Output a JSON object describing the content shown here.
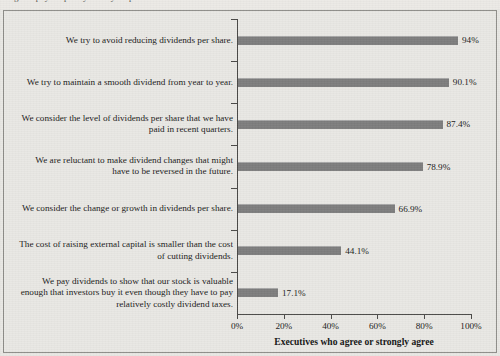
{
  "page": {
    "top_cut_text": "Figure: payout policy survey responses of chief financial officers"
  },
  "chart_data": {
    "type": "bar",
    "orientation": "horizontal",
    "title": "",
    "xlabel": "Executives who agree or strongly agree",
    "ylabel": "",
    "xlim": [
      0,
      100
    ],
    "grid": false,
    "legend": "none",
    "bar_color": "#7d7d7d",
    "categories": [
      "We try to avoid reducing dividends per share.",
      "We try to maintain a smooth dividend from year to year.",
      "We consider the level of dividends per share that we have paid in recent quarters.",
      "We are reluctant to make dividend changes that might have to be reversed in the future.",
      "We consider the change or growth in dividends per share.",
      "The cost of raising external capital is smaller than the cost of cutting dividends.",
      "We pay dividends to show that our stock is valuable enough that investors buy it even though they have to pay relatively costly dividend taxes."
    ],
    "values": [
      94,
      90.1,
      87.4,
      78.9,
      66.9,
      44.1,
      17.1
    ],
    "value_labels": [
      "94%",
      "90.1%",
      "87.4%",
      "78.9%",
      "66.9%",
      "44.1%",
      "17.1%"
    ],
    "xticks": [
      0,
      20,
      40,
      60,
      80,
      100
    ],
    "xtick_labels": [
      "0%",
      "20%",
      "40%",
      "60%",
      "80%",
      "100%"
    ]
  }
}
